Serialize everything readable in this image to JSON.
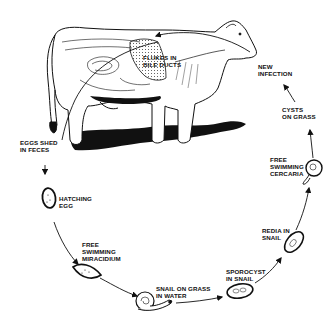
{
  "diagram": {
    "colors": {
      "ink": "#111111",
      "background": "#ffffff"
    },
    "host": {
      "name": "cow",
      "label_lines": [
        "FLUKES IN",
        "BILE DUCTS"
      ]
    },
    "stages": [
      {
        "id": "eggs",
        "lines": [
          "EGGS SHED",
          "IN FECES"
        ]
      },
      {
        "id": "hatching",
        "lines": [
          "HATCHING",
          "EGG"
        ]
      },
      {
        "id": "miracidium",
        "lines": [
          "FREE",
          "SWIMMING",
          "MIRACIDIUM"
        ]
      },
      {
        "id": "snail",
        "lines": [
          "SNAIL ON GRASS",
          "IN WATER"
        ]
      },
      {
        "id": "sporocyst",
        "lines": [
          "SPOROCYST",
          "IN SNAIL"
        ]
      },
      {
        "id": "redia",
        "lines": [
          "REDIA IN",
          "SNAIL"
        ]
      },
      {
        "id": "cercaria",
        "lines": [
          "FREE",
          "SWIMMING",
          "CERCARIA"
        ]
      },
      {
        "id": "cysts",
        "lines": [
          "CYSTS",
          "ON GRASS"
        ]
      },
      {
        "id": "infection",
        "lines": [
          "NEW",
          "INFECTION"
        ]
      }
    ]
  }
}
